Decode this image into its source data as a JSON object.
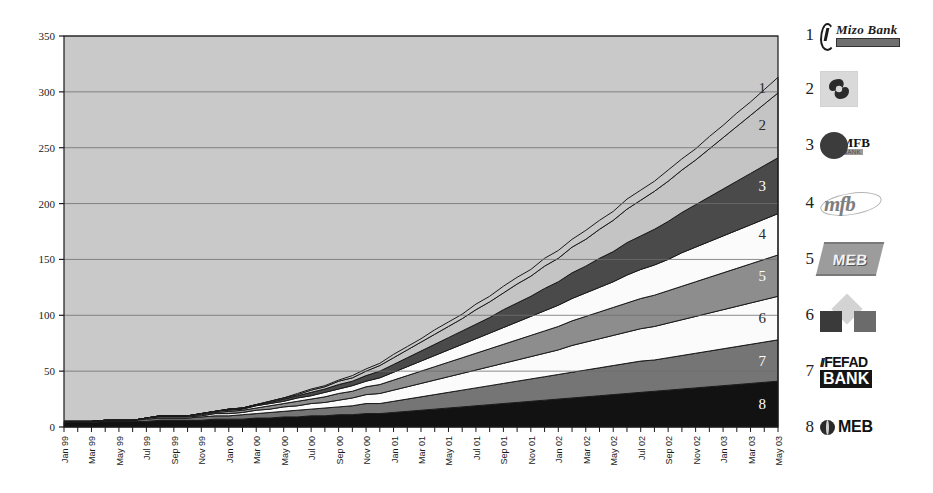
{
  "chart_data": {
    "type": "area",
    "stacked": true,
    "title": "",
    "xlabel": "",
    "ylabel": "",
    "ylim": [
      0,
      350
    ],
    "yticks": [
      0,
      50,
      100,
      150,
      200,
      250,
      300,
      350
    ],
    "grid": true,
    "legend_position": "right",
    "x": [
      "Jan 99",
      "Feb 99",
      "Mar 99",
      "Apr 99",
      "May 99",
      "Jun 99",
      "Jul 99",
      "Aug 99",
      "Sep 99",
      "Oct 99",
      "Nov 99",
      "Dec 99",
      "Jan 00",
      "Feb 00",
      "Mar 00",
      "Apr 00",
      "May 00",
      "Jun 00",
      "Jul 00",
      "Aug 00",
      "Sep 00",
      "Oct 00",
      "Nov 00",
      "Dec 00",
      "Jan 01",
      "Feb 01",
      "Mar 01",
      "Apr 01",
      "May 01",
      "Jun 01",
      "Jul 01",
      "Aug 01",
      "Sep 01",
      "Oct 01",
      "Nov 01",
      "Dec 01",
      "Jan 02",
      "Feb 02",
      "Mar 02",
      "Apr 02",
      "May 02",
      "Jun 02",
      "Jul 02",
      "Aug 02",
      "Sep 02",
      "Oct 02",
      "Nov 02",
      "Dec 02",
      "Jan 03",
      "Feb 03",
      "Mar 03",
      "Apr 03",
      "May 03"
    ],
    "xtick_labels": [
      "Jan 99",
      "Mar 99",
      "May 99",
      "Jul 99",
      "Sep 99",
      "Nov 99",
      "Jan 00",
      "Mar 00",
      "May 00",
      "Jul 00",
      "Sep 00",
      "Nov 00",
      "Jan 01",
      "Mar 01",
      "May 01",
      "Jul 01",
      "Sep 01",
      "Nov 01",
      "Jan 02",
      "Mar 02",
      "May 02",
      "Jul 02",
      "Sep 02",
      "Nov 02",
      "Jan 03",
      "Mar 03",
      "May 03"
    ],
    "series": [
      {
        "name": "8",
        "legend_label": "MEB",
        "color": "#121212",
        "order_from_bottom": 1,
        "values": [
          4,
          4,
          4,
          5,
          5,
          5,
          5,
          6,
          6,
          6,
          6,
          7,
          7,
          7,
          8,
          8,
          9,
          9,
          10,
          10,
          11,
          11,
          12,
          12,
          13,
          14,
          15,
          16,
          17,
          18,
          19,
          20,
          21,
          22,
          23,
          24,
          25,
          26,
          27,
          28,
          29,
          30,
          31,
          32,
          33,
          34,
          35,
          36,
          37,
          38,
          39,
          40,
          41
        ]
      },
      {
        "name": "7",
        "legend_label": "FEFAD BANK",
        "color": "#757575",
        "order_from_bottom": 2,
        "values": [
          1,
          1,
          1,
          1,
          1,
          1,
          2,
          2,
          2,
          2,
          3,
          3,
          3,
          4,
          4,
          5,
          5,
          6,
          6,
          7,
          7,
          8,
          9,
          9,
          10,
          11,
          12,
          13,
          14,
          15,
          16,
          17,
          18,
          19,
          20,
          21,
          22,
          23,
          24,
          25,
          26,
          27,
          28,
          28,
          29,
          30,
          31,
          32,
          33,
          34,
          35,
          36,
          37
        ]
      },
      {
        "name": "6",
        "legend_label": "Opportunity Bank (squares & diamond)",
        "color": "#fbfbfb",
        "order_from_bottom": 3,
        "values": [
          0,
          0,
          0,
          0,
          0,
          0,
          1,
          1,
          1,
          1,
          1,
          2,
          2,
          2,
          3,
          3,
          4,
          4,
          5,
          5,
          6,
          7,
          8,
          9,
          10,
          11,
          12,
          13,
          14,
          15,
          16,
          17,
          18,
          19,
          20,
          21,
          22,
          24,
          25,
          26,
          27,
          28,
          29,
          30,
          31,
          32,
          33,
          34,
          35,
          36,
          37,
          38,
          39
        ]
      },
      {
        "name": "5",
        "legend_label": "MEB",
        "color": "#8d8d8d",
        "order_from_bottom": 4,
        "values": [
          0,
          0,
          0,
          0,
          0,
          0,
          0,
          1,
          1,
          1,
          1,
          1,
          2,
          2,
          2,
          3,
          3,
          4,
          4,
          5,
          6,
          6,
          7,
          8,
          9,
          10,
          11,
          12,
          13,
          14,
          15,
          16,
          17,
          18,
          19,
          20,
          21,
          22,
          23,
          24,
          25,
          26,
          27,
          28,
          29,
          30,
          31,
          32,
          33,
          34,
          35,
          36,
          37
        ]
      },
      {
        "name": "4",
        "legend_label": "mfb",
        "color": "#fbfbfb",
        "order_from_bottom": 5,
        "values": [
          0,
          0,
          0,
          0,
          0,
          0,
          0,
          0,
          0,
          0,
          1,
          1,
          1,
          1,
          2,
          2,
          2,
          3,
          3,
          4,
          4,
          5,
          5,
          6,
          7,
          8,
          9,
          10,
          11,
          12,
          13,
          14,
          15,
          16,
          17,
          18,
          19,
          20,
          21,
          22,
          23,
          25,
          26,
          27,
          28,
          30,
          31,
          32,
          33,
          34,
          35,
          36,
          37
        ]
      },
      {
        "name": "3",
        "legend_label": "MFB",
        "color": "#4a4a4a",
        "order_from_bottom": 6,
        "values": [
          0,
          0,
          0,
          0,
          0,
          0,
          0,
          0,
          0,
          0,
          0,
          0,
          1,
          1,
          1,
          1,
          2,
          2,
          3,
          3,
          4,
          4,
          5,
          6,
          7,
          8,
          9,
          10,
          11,
          12,
          13,
          14,
          16,
          17,
          18,
          20,
          21,
          23,
          24,
          26,
          27,
          29,
          30,
          32,
          34,
          36,
          38,
          40,
          42,
          44,
          46,
          48,
          50
        ]
      },
      {
        "name": "2",
        "legend_label": "Swirl bank",
        "color": "#c4c4c4",
        "order_from_bottom": 7,
        "values": [
          0,
          0,
          0,
          0,
          0,
          0,
          0,
          0,
          0,
          0,
          0,
          0,
          0,
          0,
          0,
          1,
          1,
          1,
          2,
          2,
          3,
          3,
          4,
          5,
          6,
          7,
          8,
          9,
          10,
          11,
          13,
          14,
          15,
          17,
          18,
          20,
          21,
          23,
          24,
          26,
          28,
          30,
          32,
          34,
          36,
          38,
          40,
          43,
          46,
          49,
          52,
          55,
          58
        ]
      },
      {
        "name": "1",
        "legend_label": "Mizo Bank",
        "color": "#c8c8c8",
        "order_from_bottom": 8,
        "values": [
          0,
          0,
          0,
          0,
          0,
          0,
          0,
          0,
          0,
          0,
          0,
          0,
          0,
          0,
          0,
          0,
          0,
          1,
          1,
          1,
          1,
          2,
          2,
          2,
          3,
          3,
          3,
          4,
          4,
          4,
          5,
          5,
          6,
          6,
          6,
          7,
          7,
          7,
          8,
          8,
          8,
          9,
          9,
          9,
          10,
          10,
          10,
          11,
          11,
          12,
          12,
          13,
          14
        ]
      }
    ],
    "band_labels": [
      "1",
      "2",
      "3",
      "4",
      "5",
      "6",
      "7",
      "8"
    ]
  },
  "legend": {
    "items": [
      {
        "num": "1",
        "logo_name": "mizo-bank-logo",
        "text": "Mizo Bank"
      },
      {
        "num": "2",
        "logo_name": "swirl-logo",
        "text": ""
      },
      {
        "num": "3",
        "logo_name": "mfb-ellipse-logo",
        "text": "MFB",
        "sub": "BANK"
      },
      {
        "num": "4",
        "logo_name": "mfb-script-logo",
        "text": "mfb"
      },
      {
        "num": "5",
        "logo_name": "meb-slanted-logo",
        "text": "MEB"
      },
      {
        "num": "6",
        "logo_name": "diamond-squares-logo",
        "text": ""
      },
      {
        "num": "7",
        "logo_name": "fefad-bank-logo",
        "text": "FEFAD",
        "sub": "BANK",
        "slash": "//"
      },
      {
        "num": "8",
        "logo_name": "meb-globe-logo",
        "text": "MEB"
      }
    ]
  },
  "plot": {
    "bg_color": "#c9c9c9",
    "grid_color": "#6e6e6e",
    "axis_color": "#1a1a1a"
  }
}
